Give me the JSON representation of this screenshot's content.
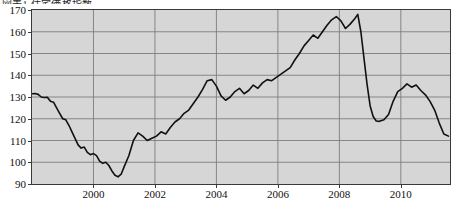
{
  "title": "図表1 住宅価格指数",
  "axes": {
    "y_ticks": [
      170,
      160,
      150,
      140,
      130,
      120,
      110,
      100,
      90
    ],
    "y_min": 90,
    "y_max": 170,
    "x_ticks": [
      2000,
      2002,
      2004,
      2006,
      2008,
      2010
    ],
    "x_min": 1998.0,
    "x_max": 2011.6
  },
  "colors": {
    "plot_background": "#d6d6d6",
    "grid": "#7d7d7d",
    "axis": "#3a3a3a",
    "line": "#111111",
    "page_background": "#ffffff"
  },
  "chart_data": {
    "type": "line",
    "title": "図表1 住宅価格指数",
    "xlabel": "",
    "ylabel": "",
    "xlim": [
      1998.0,
      2011.6
    ],
    "ylim": [
      90,
      170
    ],
    "grid": true,
    "legend": null,
    "y_tick_labels": [
      "170",
      "160",
      "150",
      "140",
      "130",
      "120",
      "110",
      "100",
      "90"
    ],
    "x_tick_labels": [
      "2000",
      "2002",
      "2004",
      "2006",
      "2008",
      "2010"
    ],
    "series": [
      {
        "name": "Index",
        "x": [
          1998.0,
          1998.1,
          1998.2,
          1998.3,
          1998.4,
          1998.5,
          1998.6,
          1998.7,
          1998.8,
          1998.9,
          1999.0,
          1999.1,
          1999.2,
          1999.3,
          1999.4,
          1999.5,
          1999.6,
          1999.7,
          1999.8,
          1999.9,
          2000.0,
          2000.1,
          2000.2,
          2000.3,
          2000.4,
          2000.5,
          2000.6,
          2000.7,
          2000.8,
          2000.9,
          2001.0,
          2001.15,
          2001.3,
          2001.45,
          2001.6,
          2001.75,
          2001.9,
          2002.05,
          2002.2,
          2002.35,
          2002.5,
          2002.65,
          2002.8,
          2002.95,
          2003.1,
          2003.25,
          2003.4,
          2003.55,
          2003.7,
          2003.85,
          2004.0,
          2004.15,
          2004.3,
          2004.45,
          2004.6,
          2004.75,
          2004.9,
          2005.05,
          2005.2,
          2005.35,
          2005.5,
          2005.65,
          2005.8,
          2005.95,
          2006.1,
          2006.25,
          2006.4,
          2006.55,
          2006.7,
          2006.85,
          2007.0,
          2007.15,
          2007.3,
          2007.45,
          2007.6,
          2007.75,
          2007.9,
          2008.05,
          2008.2,
          2008.35,
          2008.5,
          2008.6,
          2008.7,
          2008.8,
          2008.9,
          2009.0,
          2009.1,
          2009.2,
          2009.3,
          2009.45,
          2009.6,
          2009.75,
          2009.9,
          2010.05,
          2010.2,
          2010.35,
          2010.5,
          2010.65,
          2010.8,
          2010.95,
          2011.1,
          2011.25,
          2011.4,
          2011.55
        ],
        "y": [
          131.5,
          131.6,
          131.2,
          130.0,
          129.8,
          129.9,
          128.0,
          127.6,
          125.0,
          122.5,
          120.0,
          119.5,
          117.0,
          114.0,
          111.0,
          108.0,
          106.5,
          107.0,
          104.5,
          103.5,
          104.0,
          103.0,
          100.5,
          99.5,
          100.0,
          98.5,
          96.0,
          94.0,
          93.3,
          94.5,
          98.0,
          103.0,
          110.0,
          113.5,
          112.0,
          110.0,
          111.0,
          112.0,
          114.0,
          113.0,
          116.0,
          118.5,
          120.0,
          122.5,
          124.0,
          127.0,
          130.0,
          133.5,
          137.5,
          138.0,
          135.0,
          130.5,
          128.5,
          130.0,
          132.5,
          134.0,
          131.5,
          133.0,
          135.5,
          134.0,
          136.5,
          138.0,
          137.5,
          139.0,
          140.5,
          142.0,
          143.5,
          147.0,
          150.0,
          153.5,
          156.0,
          158.5,
          157.0,
          160.0,
          163.0,
          165.5,
          167.0,
          165.0,
          161.5,
          163.5,
          166.0,
          168.0,
          160.0,
          148.0,
          136.0,
          126.0,
          121.0,
          119.0,
          118.8,
          119.5,
          122.0,
          128.0,
          132.5,
          134.0,
          136.0,
          134.5,
          135.5,
          133.0,
          131.0,
          128.0,
          124.0,
          118.0,
          113.0,
          112.0
        ]
      }
    ],
    "annotations": [
      {
        "label": "peak",
        "x": 2008.6,
        "y": 168
      },
      {
        "label": "trough",
        "x": 2000.8,
        "y": 93.3
      },
      {
        "label": "post-crash-low",
        "x": 2009.3,
        "y": 118.8
      }
    ]
  }
}
